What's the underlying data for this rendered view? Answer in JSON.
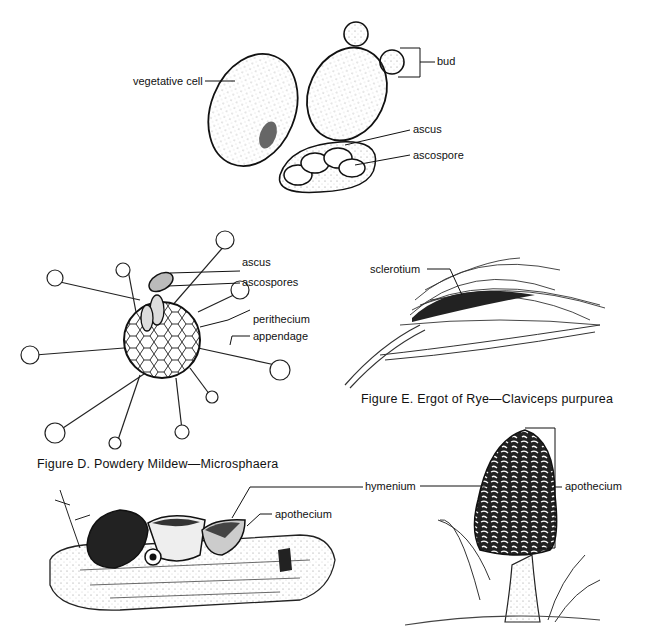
{
  "yeast": {
    "labels": {
      "vegetative_cell": "vegetative cell",
      "bud": "bud",
      "ascus": "ascus",
      "ascospore": "ascospore"
    }
  },
  "figure_d": {
    "caption": "Figure D. Powdery Mildew—Microsphaera",
    "labels": {
      "ascus": "ascus",
      "ascospores": "ascospores",
      "perithecium": "perithecium",
      "appendage": "appendage"
    }
  },
  "figure_e": {
    "caption": "Figure E. Ergot of Rye—Claviceps purpurea",
    "labels": {
      "sclerotium": "sclerotium"
    }
  },
  "cup_fungi": {
    "labels": {
      "hymenium": "hymenium",
      "apothecium": "apothecium"
    }
  },
  "morel": {
    "labels": {
      "apothecium": "apothecium"
    }
  }
}
